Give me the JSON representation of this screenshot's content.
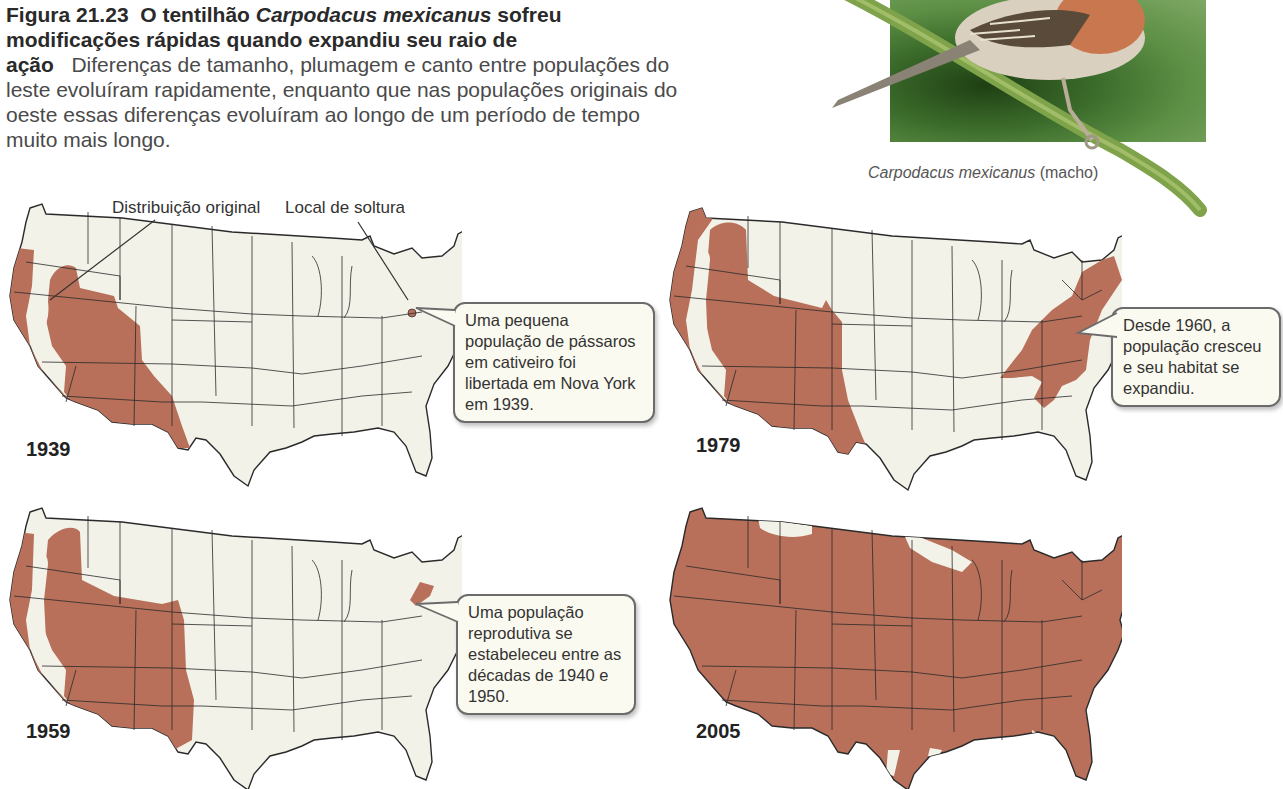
{
  "caption": {
    "figure_number": "Figura 21.23",
    "title_part1": "O tentilhão ",
    "title_species": "Carpodacus mexicanus",
    "title_part2": " sofreu modificações rápidas quando expandiu seu raio de ação",
    "body": "Diferenças de tamanho, plumagem e canto entre populações do leste evoluíram rapidamente, enquanto que nas populações originais do oeste essas diferenças evoluíram ao longo de um período de tempo muito mais longo."
  },
  "photo": {
    "species": "Carpodacus mexicanus",
    "sex": "(macho)"
  },
  "labels": {
    "original_distribution": "Distribuição original",
    "release_site": "Local de soltura"
  },
  "maps": [
    {
      "year": "1939",
      "callout": "Uma pequena população de pássaros em cativeiro foi libertada em Nova York em 1939."
    },
    {
      "year": "1979",
      "callout": "Desde 1960, a população cresceu e seu habitat se expandiu."
    },
    {
      "year": "1959",
      "callout": "Uma população reprodutiva se estabeleceu entre as décadas de 1940 e 1950."
    },
    {
      "year": "2005",
      "callout": ""
    }
  ],
  "colors": {
    "range_fill": "#b8705a",
    "map_fill": "#f3f2e9",
    "border": "#2a2a2a",
    "callout_bg": "#fbfaf0"
  }
}
